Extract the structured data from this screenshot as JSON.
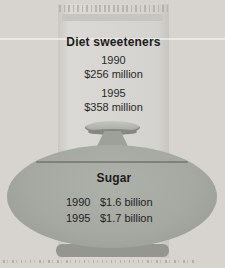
{
  "figure": {
    "packet": {
      "title": "Diet sweeteners",
      "entries": [
        {
          "year": "1990",
          "value": "$256 million"
        },
        {
          "year": "1995",
          "value": "$358 million"
        }
      ]
    },
    "bowl": {
      "title": "Sugar",
      "rows": [
        {
          "year": "1990",
          "value": "$1.6 billion"
        },
        {
          "year": "1995",
          "value": "$1.7 billion"
        }
      ]
    }
  },
  "colors": {
    "background": "#d7d3cf",
    "packet": "#d7d6d2",
    "packet_fold": "#c6c5c1",
    "bowl": "#a6a8a2",
    "bowl_base": "#95978f",
    "lid_seam": "#7f817b",
    "text": "#1c1c1a"
  },
  "chart_data": {
    "type": "bar",
    "categories": [
      "1990",
      "1995"
    ],
    "series": [
      {
        "name": "Diet sweeteners",
        "values": [
          256,
          358
        ],
        "unit": "million USD",
        "value_labels": [
          "$256 million",
          "$358 million"
        ]
      },
      {
        "name": "Sugar",
        "values": [
          1600,
          1700
        ],
        "unit": "million USD",
        "value_labels": [
          "$1.6 billion",
          "$1.7 billion"
        ]
      }
    ],
    "title": "",
    "xlabel": "",
    "ylabel": "",
    "legend_position": "none",
    "style": "pictograph: values printed on sweetener-packet and sugar-bowl illustrations"
  }
}
